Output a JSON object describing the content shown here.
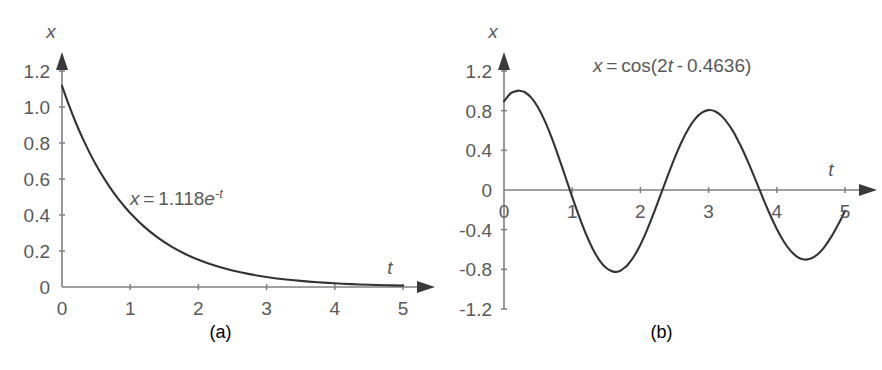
{
  "figure": {
    "background_color": "#ffffff",
    "text_color": "#595959",
    "axis_color": "#808080",
    "curve_color": "#333333",
    "panels": [
      {
        "id": "a",
        "caption": "(a)",
        "equation_parts": [
          {
            "text": "x",
            "italic": true
          },
          {
            "text": " = 1.118",
            "italic": false
          },
          {
            "text": "e",
            "italic": true
          },
          {
            "text": "-t",
            "italic": true,
            "sup": true
          }
        ],
        "equation_plain": "x = 1.118e^-t",
        "xlabel": "t",
        "ylabel": "x"
      },
      {
        "id": "b",
        "caption": "(b)",
        "equation_parts": [
          {
            "text": "x",
            "italic": true
          },
          {
            "text": " = cos(2",
            "italic": false
          },
          {
            "text": "t",
            "italic": true
          },
          {
            "text": " - 0.4636)",
            "italic": false
          }
        ],
        "equation_plain": "x = cos(2t - 0.4636)",
        "xlabel": "t",
        "ylabel": "x"
      }
    ]
  },
  "chart_data": [
    {
      "type": "line",
      "panel": "a",
      "title": "",
      "annotation": "x = 1.118e^-t",
      "xlabel": "t",
      "ylabel": "x",
      "xlim": [
        0,
        5
      ],
      "ylim": [
        0,
        1.2
      ],
      "xticks": [
        0,
        1,
        2,
        3,
        4,
        5
      ],
      "xticklabels": [
        "0",
        "1",
        "2",
        "3",
        "4",
        "5"
      ],
      "yticks": [
        0,
        0.2,
        0.4,
        0.6,
        0.8,
        1.0,
        1.2
      ],
      "yticklabels": [
        "0",
        "0.2",
        "0.4",
        "0.6",
        "0.8",
        "1.0",
        "1.2"
      ],
      "grid": false,
      "legend": false,
      "series": [
        {
          "name": "x = 1.118e^-t",
          "formula": "1.118*exp(-t)",
          "x": [
            0,
            0.1,
            0.2,
            0.3,
            0.4,
            0.5,
            0.6,
            0.7,
            0.8,
            0.9,
            1.0,
            1.2,
            1.4,
            1.6,
            1.8,
            2.0,
            2.25,
            2.5,
            2.75,
            3.0,
            3.25,
            3.5,
            3.75,
            4.0,
            4.25,
            4.5,
            4.75,
            5.0
          ],
          "y": [
            1.118,
            1.0116,
            0.9153,
            0.8282,
            0.7494,
            0.6781,
            0.6136,
            0.5552,
            0.5024,
            0.4546,
            0.4113,
            0.3368,
            0.2757,
            0.2257,
            0.1848,
            0.1513,
            0.1178,
            0.0918,
            0.0715,
            0.0557,
            0.0433,
            0.0338,
            0.0263,
            0.0205,
            0.0159,
            0.0124,
            0.0097,
            0.0075
          ]
        }
      ]
    },
    {
      "type": "line",
      "panel": "b",
      "title": "",
      "annotation": "x = cos(2t - 0.4636)",
      "xlabel": "t",
      "ylabel": "x",
      "xlim": [
        0,
        5
      ],
      "ylim": [
        -1.2,
        1.2
      ],
      "xticks": [
        0,
        1,
        2,
        3,
        4,
        5
      ],
      "xticklabels": [
        "0",
        "1",
        "2",
        "3",
        "4",
        "5"
      ],
      "yticks": [
        -1.2,
        -0.8,
        -0.4,
        0,
        0.4,
        0.8,
        1.2
      ],
      "yticklabels": [
        "-1.2",
        "-0.8",
        "-0.4",
        "0",
        "0.4",
        "0.8",
        "1.2"
      ],
      "grid": false,
      "legend": false,
      "series": [
        {
          "name": "x = cos(2t - 0.4636)",
          "formula": "cos(2*t - 0.4636)",
          "x": [
            0,
            0.1,
            0.2,
            0.2318,
            0.3,
            0.4,
            0.5,
            0.6,
            0.7,
            0.8,
            0.9,
            1.0,
            1.1,
            1.2,
            1.3,
            1.4,
            1.5,
            1.6,
            1.7,
            1.8,
            1.8026,
            1.9,
            2.0,
            2.1,
            2.2,
            2.3,
            2.4,
            2.5,
            2.6,
            2.7,
            2.8,
            2.9,
            3.0,
            3.1,
            3.2,
            3.3,
            3.374,
            3.4,
            3.5,
            3.6,
            3.7,
            3.8,
            3.9,
            4.0,
            4.1,
            4.2,
            4.3,
            4.4,
            4.5,
            4.6,
            4.7,
            4.8,
            4.9,
            4.945,
            5.0
          ],
          "y": [
            0.8944,
            0.9766,
            0.9997,
            1.0,
            0.988,
            0.932,
            0.8321,
            0.694,
            0.5252,
            0.335,
            0.1333,
            -0.0697,
            -0.2643,
            -0.441,
            -0.5915,
            -0.7087,
            -0.7871,
            -0.8233,
            -0.8159,
            -0.7657,
            -0.7643,
            -0.6757,
            -0.5515,
            -0.399,
            -0.2263,
            -0.0425,
            0.1427,
            0.3197,
            0.4793,
            0.6133,
            0.7151,
            0.7801,
            0.8058,
            0.7918,
            0.7399,
            0.654,
            0.5742,
            0.54,
            0.4033,
            0.2477,
            0.0817,
            -0.0862,
            -0.2471,
            -0.3929,
            -0.5163,
            -0.6113,
            -0.6736,
            -0.7006,
            -0.6917,
            -0.6481,
            -0.5728,
            -0.4705,
            -0.3474,
            -0.2886,
            -0.2107
          ]
        }
      ]
    }
  ]
}
